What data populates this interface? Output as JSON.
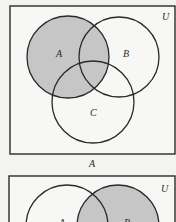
{
  "colors": {
    "background": "#f3f3f1",
    "frame_fill": "#f7f7f5",
    "stroke": "#2a2a2a",
    "shade": "#c6c6c6"
  },
  "diagrams": [
    {
      "universe_label": "U",
      "caption": "A",
      "sets": [
        {
          "label": "A",
          "shaded": true
        },
        {
          "label": "B",
          "shaded": false
        },
        {
          "label": "C",
          "shaded": false
        }
      ],
      "shaded_region": "A"
    },
    {
      "universe_label": "U",
      "sets": [
        {
          "label": "A",
          "shaded": false
        },
        {
          "label": "B",
          "shaded": true
        }
      ],
      "shaded_region": "B"
    }
  ]
}
